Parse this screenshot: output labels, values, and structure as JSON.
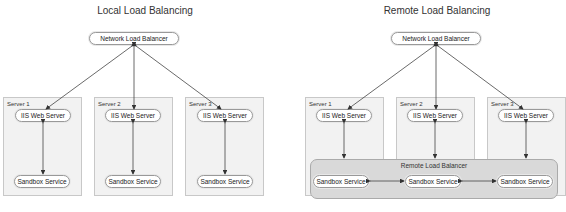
{
  "local": {
    "title": "Local Load Balancing",
    "load_balancer": "Network Load Balancer",
    "servers": [
      {
        "label": "Server 1",
        "web": "IIS Web Server",
        "sandbox": "Sandbox Service"
      },
      {
        "label": "Server 2",
        "web": "IIS Web Server",
        "sandbox": "Sandbox Service"
      },
      {
        "label": "Server 3",
        "web": "IIS Web Server",
        "sandbox": "Sandbox Service"
      }
    ]
  },
  "remote": {
    "title": "Remote Load Balancing",
    "load_balancer": "Network Load Balancer",
    "remote_balancer": "Remote Load Balancer",
    "servers": [
      {
        "label": "Server 1",
        "web": "IIS Web Server",
        "sandbox": "Sandbox Service"
      },
      {
        "label": "Server 2",
        "web": "IIS Web Server",
        "sandbox": "Sandbox Service"
      },
      {
        "label": "Server 3",
        "web": "IIS Web Server",
        "sandbox": "Sandbox Service"
      }
    ]
  }
}
